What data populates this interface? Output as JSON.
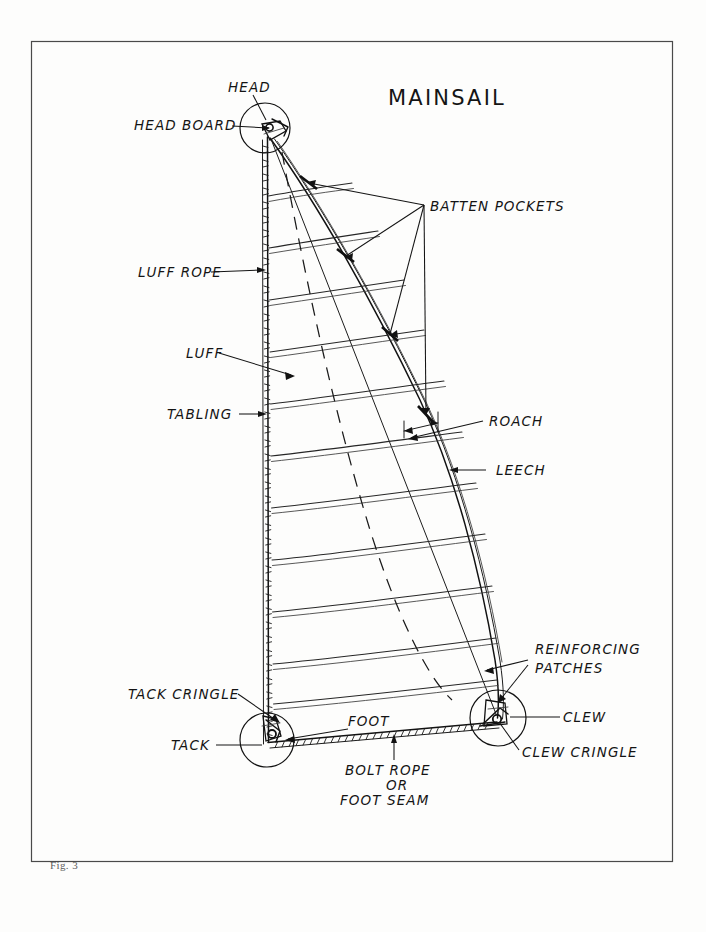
{
  "page": {
    "title": "MAINSAIL",
    "figure_caption": "Fig. 3",
    "background_color": "#fdfdfc",
    "ink_color": "#121212",
    "frame_color": "#4a4a4a"
  },
  "labels": {
    "head": "HEAD",
    "head_board": "HEAD BOARD",
    "batten_pockets": "BATTEN POCKETS",
    "luff_rope": "LUFF ROPE",
    "luff": "LUFF",
    "tabling": "TABLING",
    "roach": "ROACH",
    "leech": "LEECH",
    "reinforcing_patches_line1": "REINFORCING",
    "reinforcing_patches_line2": "PATCHES",
    "tack_cringle": "TACK CRINGLE",
    "tack": "TACK",
    "foot": "FOOT",
    "clew": "CLEW",
    "clew_cringle": "CLEW CRINGLE",
    "bolt_rope_line1": "BOLT ROPE",
    "bolt_rope_line2": "OR",
    "bolt_rope_line3": "FOOT SEAM"
  },
  "diagram": {
    "type": "technical-line-drawing",
    "parts": [
      "head",
      "head board",
      "batten pockets",
      "luff rope",
      "luff",
      "tabling",
      "roach",
      "leech",
      "reinforcing patches",
      "tack cringle",
      "tack",
      "foot",
      "clew",
      "clew cringle",
      "bolt rope or foot seam"
    ],
    "sail_corners": {
      "head": [
        268,
        132
      ],
      "tack": [
        268,
        742
      ],
      "clew": [
        497,
        718
      ]
    },
    "detail_circles": [
      {
        "name": "head-detail",
        "cx": 265,
        "cy": 128,
        "r": 25
      },
      {
        "name": "tack-detail",
        "cx": 267,
        "cy": 740,
        "r": 27
      },
      {
        "name": "clew-detail",
        "cx": 498,
        "cy": 718,
        "r": 28
      }
    ],
    "batten_count": 4,
    "seam_count": 11
  }
}
